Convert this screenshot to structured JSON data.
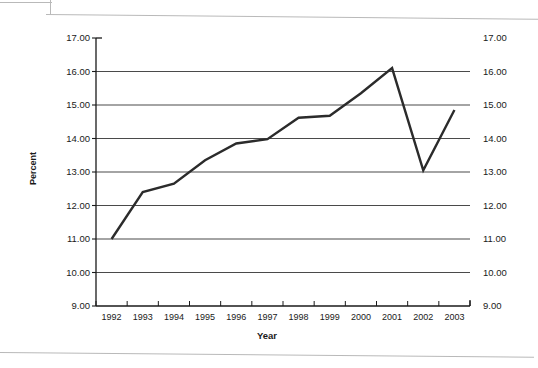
{
  "chart_data": {
    "type": "line",
    "title": "",
    "xlabel": "Year",
    "ylabel": "Percent",
    "categories": [
      "1992",
      "1993",
      "1994",
      "1995",
      "1996",
      "1997",
      "1998",
      "1999",
      "2000",
      "2001",
      "2002",
      "2003"
    ],
    "values": [
      11.0,
      12.4,
      12.65,
      13.35,
      13.85,
      13.98,
      14.62,
      14.68,
      15.35,
      16.1,
      13.05,
      14.85
    ],
    "series": [
      {
        "name": "Percent",
        "values": [
          11.0,
          12.4,
          12.65,
          13.35,
          13.85,
          13.98,
          14.62,
          14.68,
          15.35,
          16.1,
          13.05,
          14.85
        ]
      }
    ],
    "ylim": [
      9.0,
      17.0
    ],
    "ytick_step": 1.0,
    "ytick_labels": [
      "17.00",
      "16.00",
      "15.00",
      "14.00",
      "13.00",
      "12.00",
      "11.00",
      "10.00",
      "9.00"
    ],
    "ytick_values": [
      17.0,
      16.0,
      15.0,
      14.0,
      13.0,
      12.0,
      11.0,
      10.0,
      9.0
    ],
    "right_axis": true,
    "right_ytick_labels": [
      "17.00",
      "16.00",
      "15.00",
      "14.00",
      "13.00",
      "12.00",
      "11.00",
      "10.00",
      "9.00"
    ],
    "grid": true,
    "grid_axis": "y",
    "legend": false,
    "line_color": "#2b2b2b",
    "grid_color": "#4a4a4a",
    "axis_color": "#1a1a1a",
    "background_color": "#ffffff"
  },
  "axes": {
    "y_title": "Percent",
    "x_title": "Year"
  }
}
